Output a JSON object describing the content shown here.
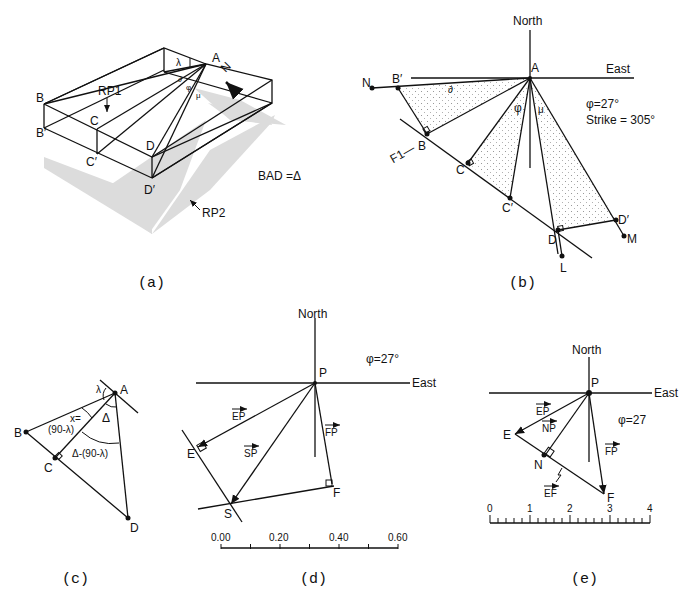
{
  "panels": {
    "a": {
      "caption": "(a)",
      "labels": {
        "A": "A",
        "B": "B",
        "B_prime": "B′",
        "C": "C",
        "C_prime": "C′",
        "D": "D",
        "D_prime": "D′",
        "rp1": "RP1",
        "rp2": "RP2",
        "north": "N",
        "lambda": "λ",
        "phi": "φ",
        "mu": "μ",
        "delta_small": "∂",
        "equation": "BAD =Δ"
      }
    },
    "b": {
      "caption": "(b)",
      "axes": {
        "north": "North",
        "east": "East"
      },
      "labels": {
        "A": "A",
        "B": "B",
        "B_prime": "B′",
        "C": "C",
        "C_prime": "C′",
        "D": "D",
        "D_prime": "D′",
        "N": "N",
        "M": "M",
        "L": "L",
        "fault": "F1—",
        "delta_small": "∂",
        "phi": "φ",
        "mu": "μ"
      },
      "phi_value": "φ=27°",
      "strike": "Strike = 305°"
    },
    "c": {
      "caption": "(c)",
      "labels": {
        "A": "A",
        "B": "B",
        "C": "C",
        "D": "D",
        "lambda": "λ",
        "delta": "Δ",
        "x_eq": "x=",
        "x_val": "(90-λ)",
        "remainder": "Δ-(90-λ)"
      }
    },
    "d": {
      "caption": "(d)",
      "axes": {
        "north": "North",
        "east": "East"
      },
      "labels": {
        "P": "P",
        "E": "E",
        "S": "S",
        "F": "F",
        "EP": "EP",
        "SP": "SP",
        "FP": "FP"
      },
      "phi_value": "φ=27°",
      "scale": {
        "ticks": [
          "0.00",
          "0.20",
          "0.40",
          "0.60"
        ],
        "minor_divisions": 6
      }
    },
    "e": {
      "caption": "(e)",
      "axes": {
        "north": "North",
        "east": "East"
      },
      "labels": {
        "P": "P",
        "E": "E",
        "N": "N",
        "F": "F",
        "EP": "EP",
        "NP": "NP",
        "FP": "FP",
        "EF": "EF"
      },
      "phi_value": "φ=27",
      "scale": {
        "ticks": [
          "0",
          "1",
          "2",
          "3",
          "4"
        ],
        "minor_divisions": 20
      }
    }
  }
}
